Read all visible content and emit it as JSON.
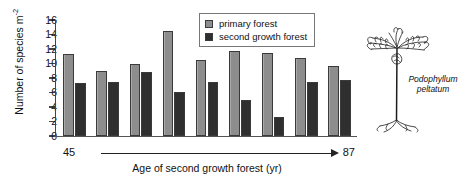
{
  "chart_data": {
    "type": "bar",
    "title": "",
    "xlabel": "Age of second growth forest (yr)",
    "ylabel": "Number of species m",
    "ylabel_exponent": "-2",
    "ylim": [
      0,
      16
    ],
    "yticks": [
      0,
      2,
      4,
      6,
      8,
      10,
      12,
      14,
      16
    ],
    "grid": false,
    "legend_position": "top-right",
    "x_axis_range_start": "45",
    "x_axis_range_end": "87",
    "x_axis_arrow": "left-to-right",
    "categories": [
      "1",
      "2",
      "3",
      "4",
      "5",
      "6",
      "7",
      "8",
      "9"
    ],
    "series": [
      {
        "name": "primary forest",
        "color": "#8d8d8d",
        "values": [
          11.3,
          9.0,
          10.0,
          14.5,
          10.5,
          11.7,
          11.5,
          10.7,
          9.6
        ]
      },
      {
        "name": "second growth forest",
        "color": "#2f2f2f",
        "values": [
          7.3,
          7.4,
          8.8,
          6.1,
          7.4,
          5.0,
          2.6,
          7.5,
          7.7
        ]
      }
    ]
  },
  "legend": {
    "entries": [
      {
        "label": "primary forest",
        "swatch": "primary"
      },
      {
        "label": "second growth forest",
        "swatch": "second"
      }
    ]
  },
  "annotation": {
    "species_line1": "Podophyllum",
    "species_line2": "peltatum"
  }
}
